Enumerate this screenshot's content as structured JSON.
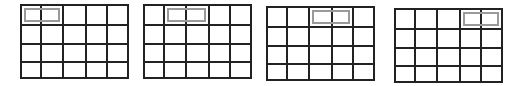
{
  "diagram": {
    "line_color": "#222222",
    "window_color": "#9a9a9a",
    "rows": 4,
    "cols": 5,
    "panels": [
      {
        "x": 20,
        "y": 4,
        "w": 109,
        "h": 75,
        "window_start_col": 0,
        "window_span": 2
      },
      {
        "x": 143,
        "y": 4,
        "w": 109,
        "h": 75,
        "window_start_col": 1,
        "window_span": 2
      },
      {
        "x": 266,
        "y": 6,
        "w": 109,
        "h": 75,
        "window_start_col": 2,
        "window_span": 2
      },
      {
        "x": 394,
        "y": 8,
        "w": 109,
        "h": 75,
        "window_start_col": 3,
        "window_span": 2
      }
    ]
  }
}
